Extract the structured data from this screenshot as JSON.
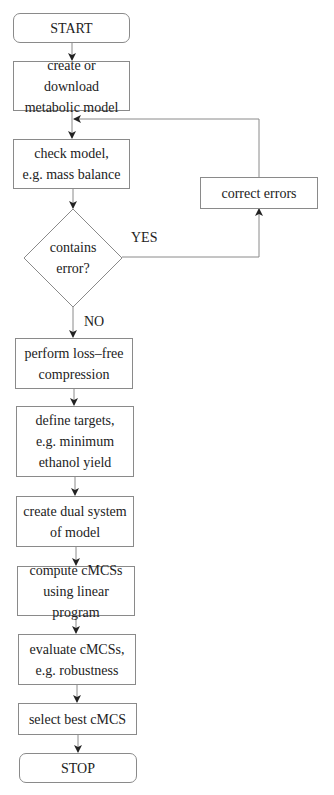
{
  "diagram": {
    "type": "flowchart",
    "nodes": {
      "start": {
        "label": "START",
        "shape": "terminal"
      },
      "create_model": {
        "label": "create or download\nmetabolic model",
        "shape": "process"
      },
      "check_model": {
        "label": "check model,\ne.g. mass balance",
        "shape": "process"
      },
      "contains_error": {
        "label": "contains\nerror?",
        "shape": "decision"
      },
      "correct_errors": {
        "label": "correct errors",
        "shape": "process"
      },
      "compression": {
        "label": "perform loss–free\ncompression",
        "shape": "process"
      },
      "define_targets": {
        "label": "define targets,\ne.g. minimum\nethanol yield",
        "shape": "process"
      },
      "dual_system": {
        "label": "create dual system\nof model",
        "shape": "process"
      },
      "compute_cmcs": {
        "label": "compute cMCSs\nusing linear program",
        "shape": "process"
      },
      "evaluate_cmcs": {
        "label": "evaluate cMCSs,\ne.g. robustness",
        "shape": "process"
      },
      "select_best": {
        "label": "select best cMCS",
        "shape": "process"
      },
      "stop": {
        "label": "STOP",
        "shape": "terminal"
      }
    },
    "edge_labels": {
      "yes": "YES",
      "no": "NO"
    },
    "edges": [
      {
        "from": "start",
        "to": "create_model"
      },
      {
        "from": "create_model",
        "to": "check_model"
      },
      {
        "from": "check_model",
        "to": "contains_error"
      },
      {
        "from": "contains_error",
        "to": "correct_errors",
        "label": "YES"
      },
      {
        "from": "correct_errors",
        "to": "check_model"
      },
      {
        "from": "contains_error",
        "to": "compression",
        "label": "NO"
      },
      {
        "from": "compression",
        "to": "define_targets"
      },
      {
        "from": "define_targets",
        "to": "dual_system"
      },
      {
        "from": "dual_system",
        "to": "compute_cmcs"
      },
      {
        "from": "compute_cmcs",
        "to": "evaluate_cmcs"
      },
      {
        "from": "evaluate_cmcs",
        "to": "select_best"
      },
      {
        "from": "select_best",
        "to": "stop"
      }
    ],
    "colors": {
      "stroke": "#8a8a8a",
      "arrow": "#222222",
      "text": "#222222",
      "background": "#ffffff"
    }
  }
}
